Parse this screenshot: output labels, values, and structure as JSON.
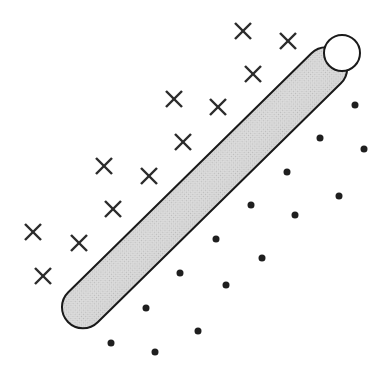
{
  "figure": {
    "width": 388,
    "height": 386,
    "background_color": "#ffffff"
  },
  "separator_bar": {
    "name": "separating-bar",
    "shape": "cylinder",
    "start_point": {
      "x": 68,
      "y": 322
    },
    "end_point": {
      "x": 342,
      "y": 53
    },
    "thickness": 42,
    "angle_degrees": 44.5,
    "fill_color": "#d5d5d5",
    "outline_color": "#1a1a1a",
    "outline_width": 2,
    "texture": "halftone",
    "end_cap_lower_left": {
      "name": "rounded-cap",
      "style": "rounded",
      "center": {
        "x": 68,
        "y": 322
      },
      "radius": 21
    },
    "end_cap_upper_right": {
      "name": "circular-cap",
      "style": "ellipse",
      "center": {
        "x": 342,
        "y": 53
      },
      "radius_x": 18,
      "radius_y": 18,
      "fill_color": "#ffffff",
      "outline_color": "#1a1a1a"
    }
  },
  "chart_data": {
    "type": "scatter",
    "xlabel": "",
    "ylabel": "",
    "xlim": [
      0,
      388
    ],
    "ylim": [
      0,
      386
    ],
    "grid": false,
    "legend": "none",
    "annotations": [
      {
        "label": "separating bar",
        "type": "thick-diagonal-band",
        "from": [
          68,
          322
        ],
        "to": [
          342,
          53
        ],
        "thickness": 42
      }
    ],
    "series": [
      {
        "name": "class-x",
        "marker": "x",
        "marker_size": 16,
        "color": "#2b2b2b",
        "side": "upper-left",
        "count": 12,
        "points": [
          [
            243,
            31
          ],
          [
            288,
            41
          ],
          [
            253,
            74
          ],
          [
            174,
            99
          ],
          [
            218,
            107
          ],
          [
            183,
            142
          ],
          [
            104,
            166
          ],
          [
            149,
            176
          ],
          [
            113,
            209
          ],
          [
            33,
            232
          ],
          [
            79,
            243
          ],
          [
            43,
            276
          ]
        ]
      },
      {
        "name": "class-dot",
        "marker": "o",
        "marker_size": 7,
        "color": "#1f1f1f",
        "side": "lower-right",
        "count": 15,
        "points": [
          [
            355,
            105
          ],
          [
            320,
            138
          ],
          [
            364,
            149
          ],
          [
            287,
            172
          ],
          [
            251,
            205
          ],
          [
            295,
            215
          ],
          [
            216,
            239
          ],
          [
            180,
            273
          ],
          [
            226,
            285
          ],
          [
            146,
            308
          ],
          [
            111,
            343
          ],
          [
            155,
            352
          ],
          [
            339,
            196
          ],
          [
            262,
            258
          ],
          [
            198,
            331
          ]
        ]
      }
    ]
  }
}
